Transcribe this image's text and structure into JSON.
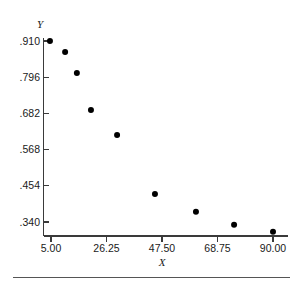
{
  "chart_data": {
    "type": "scatter",
    "title": "",
    "subtitle": "",
    "xlabel": "X",
    "ylabel": "Y",
    "xlim": [
      0.5,
      94.0
    ],
    "ylim": [
      0.283,
      0.938
    ],
    "grid": false,
    "legend": null,
    "marker": {
      "shape": "filled-circle",
      "color": "#000000",
      "size_px": 4.6
    },
    "xticks": [
      5.0,
      26.25,
      47.5,
      68.75,
      90.0
    ],
    "xtick_labels": [
      "5.00",
      "26.25",
      "47.50",
      "68.75",
      "90.00"
    ],
    "yticks": [
      0.34,
      0.454,
      0.568,
      0.682,
      0.796,
      0.91
    ],
    "ytick_labels": [
      ".340",
      ".454",
      ".568",
      ".682",
      ".796",
      ".910"
    ],
    "x": [
      4.6,
      10.4,
      14.9,
      20.3,
      30.3,
      44.8,
      60.5,
      75.1,
      90.0
    ],
    "y": [
      0.91,
      0.875,
      0.809,
      0.693,
      0.614,
      0.428,
      0.372,
      0.331,
      0.309
    ],
    "points": [
      {
        "x": 4.6,
        "y": 0.91
      },
      {
        "x": 10.4,
        "y": 0.875
      },
      {
        "x": 14.9,
        "y": 0.809
      },
      {
        "x": 20.3,
        "y": 0.693
      },
      {
        "x": 30.3,
        "y": 0.614
      },
      {
        "x": 44.8,
        "y": 0.428
      },
      {
        "x": 60.5,
        "y": 0.372
      },
      {
        "x": 75.1,
        "y": 0.331
      },
      {
        "x": 90.0,
        "y": 0.309
      }
    ]
  },
  "figure": {
    "background_color": "#ffffff",
    "axis_color": "#3a3a3a",
    "text_color": "#1a1a1a",
    "footer_rule_color": "#555555"
  }
}
